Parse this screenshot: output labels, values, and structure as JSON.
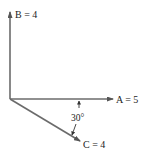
{
  "diagram": {
    "type": "vector-diagram",
    "origin": [
      10,
      99
    ],
    "vectors": [
      {
        "name": "A",
        "label": "A = 5",
        "magnitude": 5,
        "direction": "right (0°)"
      },
      {
        "name": "B",
        "label": "B = 4",
        "magnitude": 4,
        "direction": "up (90°)"
      },
      {
        "name": "C",
        "label": "C = 4",
        "magnitude": 4,
        "direction": "30° below A"
      }
    ],
    "angle": {
      "label": "30°",
      "between": [
        "A",
        "C"
      ]
    },
    "colors": {
      "arrow": "#6b6b6b",
      "text": "#222222"
    }
  }
}
